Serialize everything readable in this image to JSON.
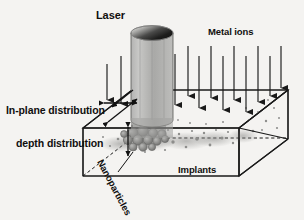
{
  "figure": {
    "background_color": "#f4f3f1",
    "line_color": "#1a1a1a",
    "beam_color": "#9a9a99",
    "particle_color": "#8c8c8a"
  },
  "labels": {
    "laser": "Laser",
    "metal_ions": "Metal ions",
    "in_plane_distribution": "In-plane distribution",
    "depth_distribution": "depth distribution",
    "nanoparticles": "Nanoparticles",
    "implants": "Implants"
  },
  "elements": {
    "laser_beam": "laser-beam-cylinder",
    "substrate": "substrate-box",
    "ion_arrows": "metal-ion-arrows",
    "nanoparticle_cluster": "nanoparticle-cluster",
    "implant_dots": "implant-dots",
    "depth_arrow": "depth-distribution-arrow",
    "in_plane_arrow": "in-plane-distribution-arrow",
    "diagonal_arrow": "in-plane-diagonal-arrow"
  },
  "colors": {
    "ink": "#1a1a1a",
    "beam_fill": "#9c9c9b",
    "beam_top_dark": "#1c1c1c",
    "particle": "#909090",
    "background": "#f4f3f1"
  }
}
